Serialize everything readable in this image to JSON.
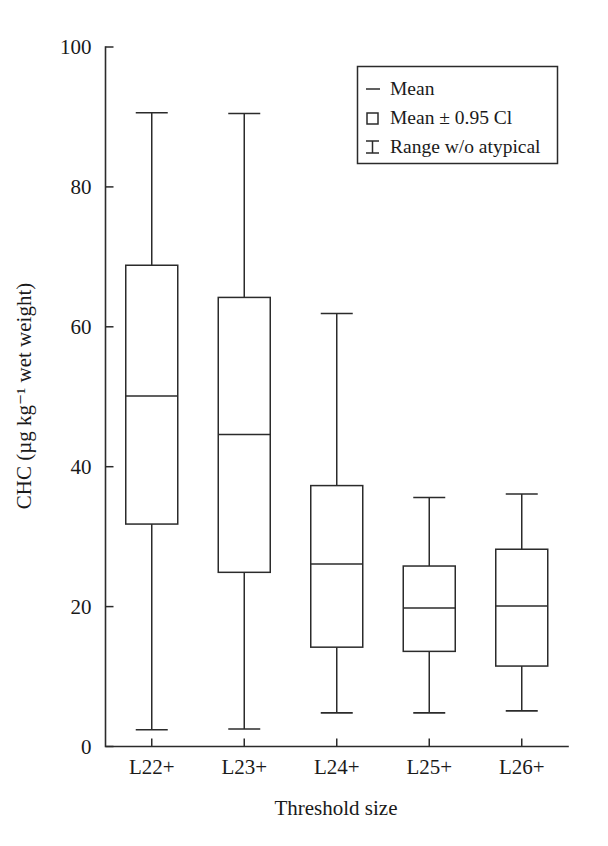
{
  "chart_data": {
    "type": "box",
    "title": "",
    "xlabel": "Threshold size",
    "ylabel": "CHC (µg kg⁻¹ wet weight)",
    "ylim": [
      0,
      100
    ],
    "yticks": [
      0,
      20,
      40,
      60,
      80,
      100
    ],
    "ytick_labels": [
      "0",
      "20",
      "40",
      "60",
      "80",
      "100"
    ],
    "categories": [
      "L22+",
      "L23+",
      "L24+",
      "L25+",
      "L26+"
    ],
    "grid": false,
    "legend_position": "top-right",
    "legend": [
      {
        "symbol": "dash",
        "label": "Mean"
      },
      {
        "symbol": "square",
        "label": "Mean ± 0.95 Cl"
      },
      {
        "symbol": "ibar",
        "label": "Range w/o atypical"
      }
    ],
    "boxes": [
      {
        "category": "L22+",
        "whisker_low": 2.4,
        "box_low": 31.8,
        "mean": 50.1,
        "box_high": 68.8,
        "whisker_high": 90.6
      },
      {
        "category": "L23+",
        "whisker_low": 2.5,
        "box_low": 24.9,
        "mean": 44.6,
        "box_high": 64.2,
        "whisker_high": 90.5
      },
      {
        "category": "L24+",
        "whisker_low": 4.8,
        "box_low": 14.2,
        "mean": 26.1,
        "box_high": 37.3,
        "whisker_high": 61.9
      },
      {
        "category": "L25+",
        "whisker_low": 4.8,
        "box_low": 13.6,
        "mean": 19.8,
        "box_high": 25.8,
        "whisker_high": 35.6
      },
      {
        "category": "L26+",
        "whisker_low": 5.1,
        "box_low": 11.5,
        "mean": 20.1,
        "box_high": 28.2,
        "whisker_high": 36.1
      }
    ]
  }
}
